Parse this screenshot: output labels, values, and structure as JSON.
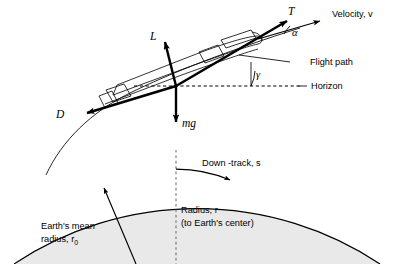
{
  "figure": {
    "type": "free-body-diagram",
    "background_color": "#ffffff",
    "stroke_color": "#000000",
    "earth_fill_color": "#e9e9e9"
  },
  "labels": {
    "thrust": "T",
    "lift": "L",
    "drag": "D",
    "weight": "mg",
    "velocity": "Velocity, v",
    "flight_path": "Flight path",
    "horizon": "Horizon",
    "down_track": "Down -track, s",
    "radius_line1": "Radius, r",
    "radius_line2": "(to Earth's center)",
    "earth_radius_line1": "Earth's mean",
    "earth_radius_line2_prefix": "radius, r",
    "earth_radius_subscript": "0",
    "angle_alpha": "α",
    "angle_gamma": "γ"
  },
  "vectors": [
    {
      "name": "thrust",
      "symbol": "T",
      "direction": "up-right along body axis"
    },
    {
      "name": "lift",
      "symbol": "L",
      "direction": "up-left perpendicular to flight path"
    },
    {
      "name": "drag",
      "symbol": "D",
      "direction": "down-left opposite velocity"
    },
    {
      "name": "weight",
      "symbol": "mg",
      "direction": "straight down toward Earth center"
    },
    {
      "name": "velocity",
      "symbol": "v",
      "direction": "up-right along flight path"
    }
  ],
  "angles": [
    {
      "name": "angle-of-attack",
      "symbol": "α",
      "between": [
        "thrust axis",
        "velocity vector"
      ]
    },
    {
      "name": "flight-path-angle",
      "symbol": "γ",
      "between": [
        "horizon",
        "flight path"
      ]
    }
  ],
  "references": [
    {
      "name": "horizon",
      "style": "dashed",
      "label": "Horizon"
    },
    {
      "name": "flight-path",
      "style": "solid-thin",
      "label": "Flight path"
    },
    {
      "name": "radius",
      "style": "dashed-vertical",
      "label": "Radius, r"
    },
    {
      "name": "down-track",
      "style": "arc-arrow",
      "label": "Down -track, s"
    }
  ]
}
